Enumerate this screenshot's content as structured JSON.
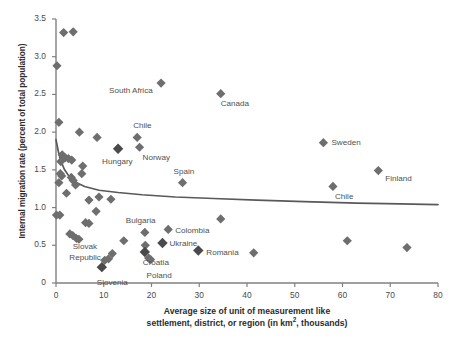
{
  "chart_data": {
    "type": "scatter",
    "title": "",
    "xlabel_line1": "Average size of unit of measurement like",
    "xlabel_line2_a": "settlement, district, or region (in km",
    "xlabel_line2_sup": "2",
    "xlabel_line2_b": ", thousands)",
    "ylabel": "Internal migration rate (percent of total population)",
    "xlim": [
      0,
      80
    ],
    "ylim": [
      0,
      3.5
    ],
    "xticks": [
      0,
      10,
      20,
      30,
      40,
      50,
      60,
      70,
      80
    ],
    "xtick_labels": [
      "0",
      "10",
      "20",
      "30",
      "40",
      "50",
      "60",
      "70",
      "80"
    ],
    "yticks": [
      0,
      0.5,
      1.0,
      1.5,
      2.0,
      2.5,
      3.0,
      3.5
    ],
    "ytick_labels": [
      "0",
      "0.5",
      "1.0",
      "1.5",
      "2.0",
      "2.5",
      "3.0",
      "3.5"
    ],
    "grid": false,
    "legend": "none",
    "marker": "diamond",
    "marker_color": "#6e6e6e",
    "marker_color_highlight": "#4a4a4a",
    "trend_color": "#595959",
    "axis_color": "#808080",
    "points": [
      {
        "x": 1.6,
        "y": 3.32,
        "label": "",
        "highlight": false
      },
      {
        "x": 3.6,
        "y": 3.33,
        "label": "",
        "highlight": false
      },
      {
        "x": 0.2,
        "y": 2.88,
        "label": "",
        "highlight": false
      },
      {
        "x": 22.0,
        "y": 2.65,
        "label": "South Africa",
        "highlight": false,
        "label_dx": -52,
        "label_dy": 8
      },
      {
        "x": 34.5,
        "y": 2.51,
        "label": "Canada",
        "highlight": false,
        "label_dx": 0,
        "label_dy": 10
      },
      {
        "x": 0.6,
        "y": 2.13,
        "label": "",
        "highlight": false
      },
      {
        "x": 4.9,
        "y": 2.0,
        "label": "",
        "highlight": false
      },
      {
        "x": 8.6,
        "y": 1.93,
        "label": "",
        "highlight": false
      },
      {
        "x": 17.0,
        "y": 1.93,
        "label": "Chile",
        "highlight": false,
        "label_dx": -4,
        "label_dy": -11
      },
      {
        "x": 56.0,
        "y": 1.86,
        "label": "Sweden",
        "highlight": false,
        "label_dx": 8,
        "label_dy": 0
      },
      {
        "x": 17.5,
        "y": 1.8,
        "label": "Norway",
        "highlight": false,
        "label_dx": 3,
        "label_dy": 11
      },
      {
        "x": 13.0,
        "y": 1.78,
        "label": "Hungary",
        "highlight": true,
        "label_dx": -16,
        "label_dy": 13
      },
      {
        "x": 1.3,
        "y": 1.7,
        "label": "",
        "highlight": false
      },
      {
        "x": 1.9,
        "y": 1.66,
        "label": "",
        "highlight": false
      },
      {
        "x": 2.6,
        "y": 1.65,
        "label": "",
        "highlight": false
      },
      {
        "x": 3.3,
        "y": 1.63,
        "label": "",
        "highlight": false
      },
      {
        "x": 1.0,
        "y": 1.61,
        "label": "",
        "highlight": false
      },
      {
        "x": 5.6,
        "y": 1.55,
        "label": "",
        "highlight": false
      },
      {
        "x": 67.5,
        "y": 1.49,
        "label": "Finland",
        "highlight": false,
        "label_dx": 7,
        "label_dy": 8
      },
      {
        "x": 5.4,
        "y": 1.45,
        "label": "",
        "highlight": false
      },
      {
        "x": 0.9,
        "y": 1.45,
        "label": "",
        "highlight": false
      },
      {
        "x": 1.2,
        "y": 1.42,
        "label": "",
        "highlight": false
      },
      {
        "x": 3.2,
        "y": 1.4,
        "label": "",
        "highlight": false
      },
      {
        "x": 3.6,
        "y": 1.36,
        "label": "",
        "highlight": false
      },
      {
        "x": 26.5,
        "y": 1.33,
        "label": "Spain",
        "highlight": false,
        "label_dx": -9,
        "label_dy": -11
      },
      {
        "x": 0.6,
        "y": 1.33,
        "label": "",
        "highlight": false
      },
      {
        "x": 4.1,
        "y": 1.3,
        "label": "",
        "highlight": false
      },
      {
        "x": 58.0,
        "y": 1.28,
        "label": "Chile",
        "highlight": false,
        "label_dx": 2,
        "label_dy": 11
      },
      {
        "x": 2.2,
        "y": 1.19,
        "label": "",
        "highlight": false
      },
      {
        "x": 9.0,
        "y": 1.14,
        "label": "",
        "highlight": false
      },
      {
        "x": 6.9,
        "y": 1.1,
        "label": "",
        "highlight": false
      },
      {
        "x": 11.5,
        "y": 1.11,
        "label": "",
        "highlight": false
      },
      {
        "x": 8.4,
        "y": 0.95,
        "label": "",
        "highlight": false
      },
      {
        "x": 0.1,
        "y": 0.9,
        "label": "",
        "highlight": false
      },
      {
        "x": 0.8,
        "y": 0.9,
        "label": "",
        "highlight": false
      },
      {
        "x": 34.5,
        "y": 0.85,
        "label": "",
        "highlight": false
      },
      {
        "x": 6.2,
        "y": 0.8,
        "label": "",
        "highlight": false
      },
      {
        "x": 6.9,
        "y": 0.79,
        "label": "",
        "highlight": false
      },
      {
        "x": 23.5,
        "y": 0.71,
        "label": "Colombia",
        "highlight": false,
        "label_dx": 7,
        "label_dy": 2
      },
      {
        "x": 18.6,
        "y": 0.67,
        "label": "Bulgaria",
        "highlight": false,
        "label_dx": -19,
        "label_dy": -11
      },
      {
        "x": 2.9,
        "y": 0.65,
        "label": "",
        "highlight": false
      },
      {
        "x": 3.5,
        "y": 0.63,
        "label": "",
        "highlight": false
      },
      {
        "x": 4.3,
        "y": 0.59,
        "label": "",
        "highlight": false
      },
      {
        "x": 4.8,
        "y": 0.58,
        "label": "",
        "highlight": false
      },
      {
        "x": 61.0,
        "y": 0.56,
        "label": "",
        "highlight": false
      },
      {
        "x": 14.2,
        "y": 0.56,
        "label": "",
        "highlight": false
      },
      {
        "x": 22.3,
        "y": 0.53,
        "label": "Ukraine",
        "highlight": true,
        "label_dx": 7,
        "label_dy": 1
      },
      {
        "x": 18.7,
        "y": 0.5,
        "label": "",
        "highlight": false
      },
      {
        "x": 73.5,
        "y": 0.47,
        "label": "",
        "highlight": false
      },
      {
        "x": 29.8,
        "y": 0.43,
        "label": "Romania",
        "highlight": true,
        "label_dx": 8,
        "label_dy": 2
      },
      {
        "x": 41.4,
        "y": 0.4,
        "label": "",
        "highlight": false
      },
      {
        "x": 18.6,
        "y": 0.41,
        "label": "Croatia",
        "highlight": true,
        "label_dx": -2,
        "label_dy": 11
      },
      {
        "x": 11.8,
        "y": 0.39,
        "label": "",
        "highlight": false
      },
      {
        "x": 19.4,
        "y": 0.33,
        "label": "",
        "highlight": false
      },
      {
        "x": 19.8,
        "y": 0.31,
        "label": "Poland",
        "highlight": false,
        "label_dx": -4,
        "label_dy": 16
      },
      {
        "x": 11.0,
        "y": 0.32,
        "label": "",
        "highlight": false
      },
      {
        "x": 10.2,
        "y": 0.3,
        "label": "",
        "highlight": false
      },
      {
        "x": 9.6,
        "y": 0.21,
        "label": "Slovenia",
        "highlight": true,
        "label_dx": -5,
        "label_dy": 16
      }
    ],
    "extra_labels": [
      {
        "text": "Slovak",
        "x": 3.5,
        "y": 0.48
      },
      {
        "text": "Republic",
        "x": 2.8,
        "y": 0.33
      }
    ],
    "trend": {
      "description": "fitted power/log decay curve",
      "points": [
        {
          "x": 0.0,
          "y": 1.9
        },
        {
          "x": 0.5,
          "y": 1.74
        },
        {
          "x": 1.0,
          "y": 1.62
        },
        {
          "x": 1.8,
          "y": 1.5
        },
        {
          "x": 2.8,
          "y": 1.41
        },
        {
          "x": 4.0,
          "y": 1.34
        },
        {
          "x": 6.0,
          "y": 1.28
        },
        {
          "x": 9.0,
          "y": 1.23
        },
        {
          "x": 13.0,
          "y": 1.2
        },
        {
          "x": 18.0,
          "y": 1.17
        },
        {
          "x": 25.0,
          "y": 1.14
        },
        {
          "x": 33.0,
          "y": 1.12
        },
        {
          "x": 42.0,
          "y": 1.1
        },
        {
          "x": 52.0,
          "y": 1.08
        },
        {
          "x": 63.0,
          "y": 1.06
        },
        {
          "x": 72.0,
          "y": 1.05
        },
        {
          "x": 80.0,
          "y": 1.04
        }
      ]
    }
  }
}
